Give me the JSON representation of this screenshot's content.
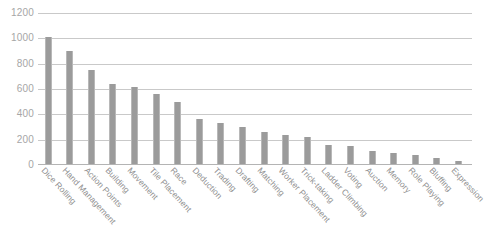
{
  "chart_data": {
    "type": "bar",
    "title": "",
    "subtitle": "",
    "xlabel": "",
    "ylabel": "",
    "ylim": [
      0,
      1200
    ],
    "ytick_step": 200,
    "yticks": [
      0,
      200,
      400,
      600,
      800,
      1000,
      1200
    ],
    "ytick_labels": [
      "0",
      "200",
      "400",
      "600",
      "800",
      "1000",
      "1200"
    ],
    "grid": true,
    "legend": false,
    "legend_position": "none",
    "bar_color": "#9b9b9b",
    "grid_color": "#c9c9c9",
    "label_color": "#8f8f8f",
    "categories": [
      "Dice Rolling",
      "Hand Management",
      "Action Points",
      "Building",
      "Movement",
      "Tile Placement",
      "Race",
      "Deduction",
      "Trading",
      "Drafting",
      "Matching",
      "Worker Placement",
      "Trick-taking",
      "Ladder Climbing",
      "Voting",
      "Auction",
      "Memory",
      "Role Playing",
      "Bluffing",
      "Expression"
    ],
    "values": [
      1000,
      890,
      745,
      630,
      610,
      555,
      490,
      355,
      325,
      295,
      250,
      230,
      215,
      150,
      140,
      105,
      90,
      70,
      45,
      25
    ]
  }
}
